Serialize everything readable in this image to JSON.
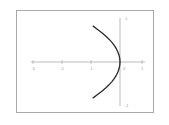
{
  "chart_data": {
    "type": "line",
    "title": "",
    "subtitle": "",
    "xlabel": "",
    "ylabel": "",
    "xlim": [
      -3.6,
      1.4
    ],
    "ylim": [
      -1.35,
      1.35
    ],
    "grid": false,
    "legend": null,
    "curve_name": "parabola",
    "equation": "x = -y^2",
    "x_ticks": [
      -3,
      -2,
      -1,
      0,
      1
    ],
    "x_tick_labels": [
      "-3",
      "-2",
      "-1",
      "0",
      "1"
    ],
    "y_ticks": [
      1,
      -1
    ],
    "y_tick_labels": [
      "1",
      "-1"
    ],
    "series": [
      {
        "name": "x = -y^2",
        "points": [
          {
            "x": -1.2,
            "y": 1.1
          },
          {
            "x": -1.0,
            "y": 1.0
          },
          {
            "x": -0.81,
            "y": 0.9
          },
          {
            "x": -0.64,
            "y": 0.8
          },
          {
            "x": -0.49,
            "y": 0.7
          },
          {
            "x": -0.36,
            "y": 0.6
          },
          {
            "x": -0.25,
            "y": 0.5
          },
          {
            "x": -0.16,
            "y": 0.4
          },
          {
            "x": -0.09,
            "y": 0.3
          },
          {
            "x": -0.04,
            "y": 0.2
          },
          {
            "x": -0.01,
            "y": 0.1
          },
          {
            "x": 0.0,
            "y": 0.0
          },
          {
            "x": -0.01,
            "y": -0.1
          },
          {
            "x": -0.04,
            "y": -0.2
          },
          {
            "x": -0.09,
            "y": -0.3
          },
          {
            "x": -0.16,
            "y": -0.4
          },
          {
            "x": -0.25,
            "y": -0.5
          },
          {
            "x": -0.36,
            "y": -0.6
          },
          {
            "x": -0.49,
            "y": -0.7
          },
          {
            "x": -0.64,
            "y": -0.8
          },
          {
            "x": -0.81,
            "y": -0.9
          },
          {
            "x": -1.0,
            "y": -1.0
          },
          {
            "x": -1.2,
            "y": -1.1
          }
        ]
      }
    ],
    "colors": {
      "curve": "#2b2b2b",
      "axis": "#a9a9a9",
      "frame": "#a8a8a8",
      "tick_text": "#9a9a9a",
      "background": "#ffffff"
    }
  }
}
